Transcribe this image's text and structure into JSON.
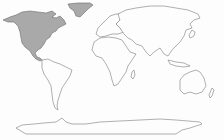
{
  "map": {
    "type": "world outline map",
    "projection": "equirectangular",
    "highlight_color": "#a9a9a9",
    "land_fill": "#fdfdfd",
    "outline_color": "#7a7a7a",
    "background": "#fdfdfd",
    "highlighted_regions": [
      "North America",
      "Greenland"
    ],
    "regions": [
      {
        "name": "North America",
        "highlighted": true
      },
      {
        "name": "Greenland",
        "highlighted": true
      },
      {
        "name": "South America",
        "highlighted": false
      },
      {
        "name": "Europe",
        "highlighted": false
      },
      {
        "name": "Africa",
        "highlighted": false
      },
      {
        "name": "Asia",
        "highlighted": false
      },
      {
        "name": "Australia",
        "highlighted": false
      },
      {
        "name": "Antarctica",
        "highlighted": false
      }
    ]
  }
}
